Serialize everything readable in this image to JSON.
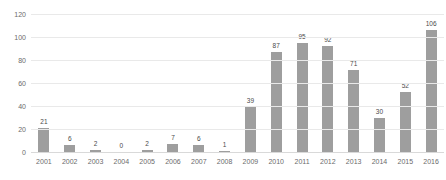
{
  "chart_data": {
    "type": "bar",
    "title": "",
    "xlabel": "",
    "ylabel": "",
    "categories": [
      "2001",
      "2002",
      "2003",
      "2004",
      "2005",
      "2006",
      "2007",
      "2008",
      "2009",
      "2010",
      "2011",
      "2012",
      "2013",
      "2014",
      "2015",
      "2016"
    ],
    "values": [
      21,
      6,
      2,
      0,
      2,
      7,
      6,
      1,
      39,
      87,
      95,
      92,
      71,
      30,
      52,
      106
    ],
    "ylim": [
      0,
      120
    ],
    "yticks": [
      0,
      20,
      40,
      60,
      80,
      100,
      120
    ],
    "ytick_labels": [
      "0",
      "20",
      "40",
      "60",
      "80",
      "100",
      "120"
    ],
    "data_labels": [
      "21",
      "6",
      "2",
      "0",
      "2",
      "7",
      "6",
      "1",
      "39",
      "87",
      "95",
      "92",
      "71",
      "30",
      "52",
      "106"
    ],
    "grid": true,
    "legend": false,
    "legend_position": "none",
    "colors": {
      "bar": "#9e9e9e",
      "gridline": "#e9e9e9",
      "baseline": "#d9d9d9",
      "tick_label": "#6b6b6b",
      "data_label": "#4a4a4a",
      "background": "#ffffff"
    }
  }
}
